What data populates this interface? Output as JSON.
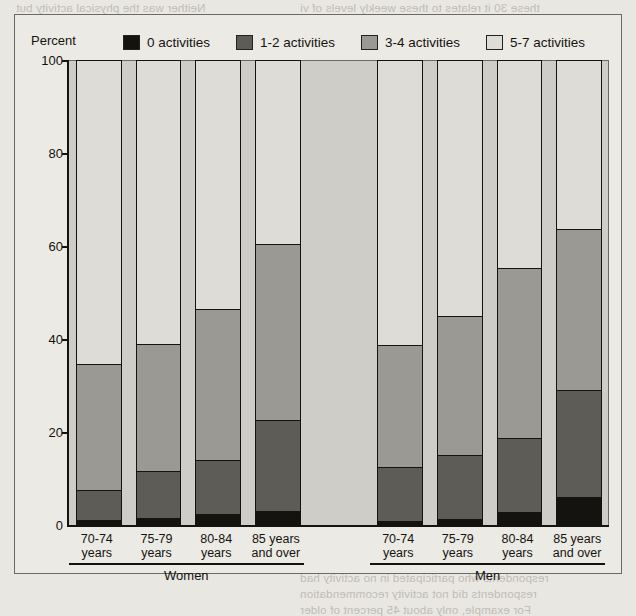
{
  "figure": {
    "y_axis_title": "Percent",
    "legend": [
      {
        "label": "0 activities",
        "color": "#15130f",
        "name": "legend-0-activities"
      },
      {
        "label": "1-2 activities",
        "color": "#5e5c57",
        "name": "legend-1-2-activities"
      },
      {
        "label": "3-4 activities",
        "color": "#9b9993",
        "name": "legend-3-4-activities"
      },
      {
        "label": "5-7 activities",
        "color": "#dedcd6",
        "name": "legend-5-7-activities"
      }
    ],
    "group_labels": [
      "Women",
      "Men"
    ]
  },
  "chart_data": {
    "type": "bar",
    "subtype": "stacked-bar-100",
    "title": "",
    "xlabel": "",
    "ylabel": "Percent",
    "ylim": [
      0,
      100
    ],
    "yticks": [
      0,
      20,
      40,
      60,
      80,
      100
    ],
    "grid": false,
    "legend_position": "top",
    "groups": [
      "Women",
      "Men"
    ],
    "categories": [
      "70-74 years",
      "75-79 years",
      "80-84 years",
      "85 years and over"
    ],
    "category_lines": [
      [
        "70-74",
        "years"
      ],
      [
        "75-79",
        "years"
      ],
      [
        "80-84",
        "years"
      ],
      [
        "85 years",
        "and over"
      ]
    ],
    "series": [
      {
        "name": "0 activities",
        "color": "#15130f",
        "values": {
          "Women": [
            1.0,
            1.5,
            2.4,
            3.0
          ],
          "Men": [
            0.9,
            1.2,
            2.8,
            6.0
          ]
        }
      },
      {
        "name": "1-2 activities",
        "color": "#5e5c57",
        "values": {
          "Women": [
            6.5,
            10.1,
            11.6,
            19.5
          ],
          "Men": [
            11.6,
            13.8,
            15.9,
            23.0
          ]
        }
      },
      {
        "name": "3-4 activities",
        "color": "#9b9993",
        "values": {
          "Women": [
            27.2,
            27.4,
            32.5,
            38.0
          ],
          "Men": [
            26.2,
            30.0,
            36.6,
            34.7
          ]
        }
      },
      {
        "name": "5-7 activities",
        "color": "#dedcd6",
        "values": {
          "Women": [
            65.3,
            61.0,
            53.5,
            39.5
          ],
          "Men": [
            61.3,
            55.0,
            44.7,
            36.3
          ]
        }
      }
    ],
    "cumulative_tops": {
      "Women": [
        34.7,
        39.0,
        46.5,
        60.5
      ],
      "Men": [
        38.7,
        45.0,
        55.3,
        63.7
      ]
    }
  },
  "bleed_text": [
    {
      "t": "Neither was the physical activity but",
      "x": 16,
      "y": 2
    },
    {
      "t": "these 30 it relates to these weekly levels of vi",
      "x": 300,
      "y": 2
    },
    {
      "t": "of health respondents who take the role of",
      "x": 16,
      "y": 16
    },
    {
      "t": "as 10 percent of the older adults who respond",
      "x": 300,
      "y": 16
    },
    {
      "t": "higher education. Those were higher and",
      "x": 16,
      "y": 30
    },
    {
      "t": "Even in the genes of activity is associated for",
      "x": 300,
      "y": 30
    },
    {
      "t": "had a lower than average of people",
      "x": 360,
      "y": 60
    },
    {
      "t": "less likely to report a walking level",
      "x": 360,
      "y": 76
    },
    {
      "t": "physical activity of older persons",
      "x": 360,
      "y": 92
    },
    {
      "t": "in the survey were the same",
      "x": 360,
      "y": 108
    },
    {
      "t": "Physical activity and participation",
      "x": 330,
      "y": 176
    },
    {
      "t": "the percentage of respondents who",
      "x": 330,
      "y": 192
    },
    {
      "t": "activities. Those 85 years of",
      "x": 330,
      "y": 208
    },
    {
      "t": "and over were most likely with",
      "x": 330,
      "y": 224
    },
    {
      "t": "low levels of activity than",
      "x": 330,
      "y": 240
    },
    {
      "t": "younger people",
      "x": 330,
      "y": 256
    },
    {
      "t": "and over were 20 percent",
      "x": 460,
      "y": 452
    },
    {
      "t": "respondents who participated in no activity had",
      "x": 300,
      "y": 572
    },
    {
      "t": "respondents did not activity recommendation",
      "x": 300,
      "y": 588
    },
    {
      "t": "For example, only about 45 percent of older",
      "x": 300,
      "y": 604
    }
  ]
}
